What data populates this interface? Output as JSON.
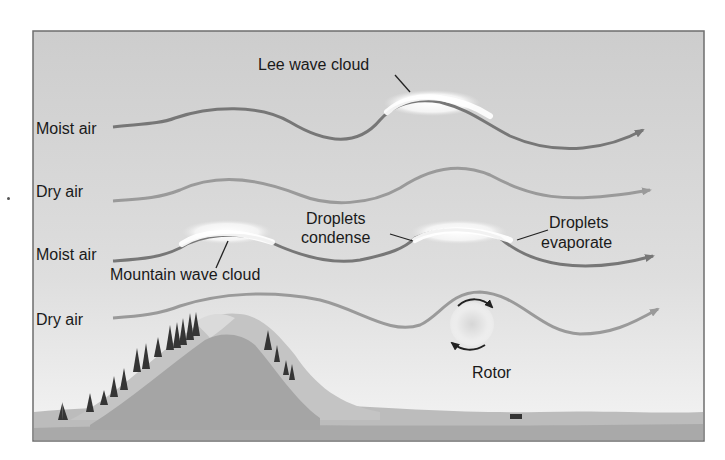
{
  "diagram": {
    "colors": {
      "sky_top": "#cfcfcf",
      "sky_bottom": "#f2f2f2",
      "frame": "#6e6e6e",
      "moist_air_stream": "#777777",
      "dry_air_stream": "#9a9a9a",
      "cloud": "#ffffff",
      "mountain_far": "#bdbdbd",
      "mountain_near": "#9e9e9e",
      "ground": "#a8a8a8",
      "trees": "#3a3a3a",
      "text": "#1a1a1a"
    },
    "streams": [
      {
        "label": "Moist air",
        "type": "moist"
      },
      {
        "label": "Dry air",
        "type": "dry"
      },
      {
        "label": "Moist air",
        "type": "moist"
      },
      {
        "label": "Dry air",
        "type": "dry"
      }
    ],
    "annotations": {
      "lee_wave_cloud": "Lee wave cloud",
      "mountain_wave_cloud": "Mountain wave cloud",
      "droplets_condense_line1": "Droplets",
      "droplets_condense_line2": "condense",
      "droplets_evaporate_line1": "Droplets",
      "droplets_evaporate_line2": "evaporate",
      "rotor": "Rotor"
    },
    "icons": [
      "rotor-circulation-arrows-icon",
      "tree-icon",
      "vehicle-icon",
      "flow-arrow-icon"
    ]
  }
}
